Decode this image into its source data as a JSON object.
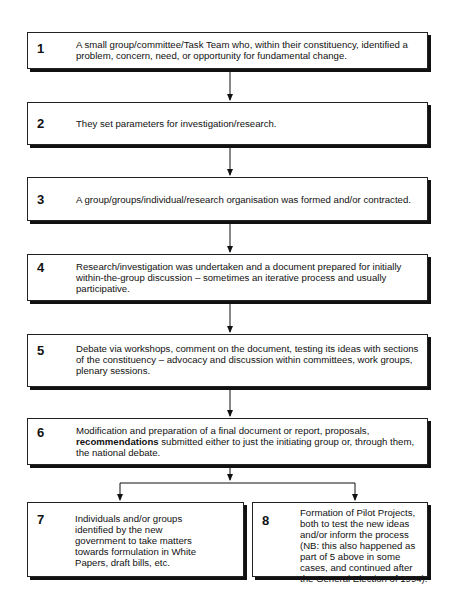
{
  "diagram": {
    "type": "flowchart",
    "steps": [
      {
        "number": "1",
        "text": "A small group/committee/Task Team who, within their constituency, identified a problem, concern, need, or opportunity for fundamental change."
      },
      {
        "number": "2",
        "text": "They set parameters for investigation/research."
      },
      {
        "number": "3",
        "text": "A group/groups/individual/research organisation was formed and/or contracted."
      },
      {
        "number": "4",
        "text": "Research/investigation was undertaken and a document prepared for initially within-the-group discussion – sometimes an iterative process and usually participative."
      },
      {
        "number": "5",
        "text": "Debate via workshops, comment on the document, testing its ideas with sections of the constituency – advocacy and discussion within committees, work groups, plenary sessions."
      },
      {
        "number": "6",
        "text_before": "Modification and preparation of a final document or report, proposals,",
        "text_bold": "recommendations",
        "text_after": "submitted either to just the initiating group or, through them, the national debate."
      },
      {
        "number": "7",
        "text": "Individuals and/or groups identified by the new government to take matters towards formulation in White Papers, draft bills, etc."
      },
      {
        "number": "8",
        "text": "Formation of Pilot Projects, both to test the new ideas and/or inform the process (NB: this also happened as part of 5 above in some cases, and continued after the General Election of 1994)."
      }
    ],
    "edges": [
      {
        "from": "1",
        "to": "2"
      },
      {
        "from": "2",
        "to": "3"
      },
      {
        "from": "3",
        "to": "4"
      },
      {
        "from": "4",
        "to": "5"
      },
      {
        "from": "5",
        "to": "6"
      },
      {
        "from": "6",
        "to": "7"
      },
      {
        "from": "6",
        "to": "8"
      }
    ]
  }
}
